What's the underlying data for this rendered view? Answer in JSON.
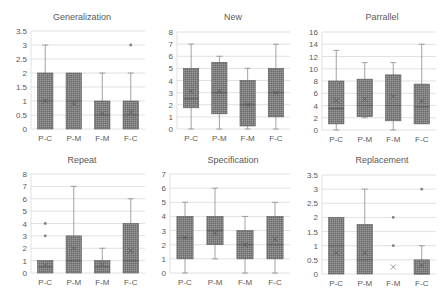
{
  "figure": {
    "box_fill": "#7f7f7f",
    "box_stroke": "#595959",
    "whisker_color": "#8c8c8c",
    "grid_color": "#d9d9d9",
    "text_color": "#595959"
  },
  "chart_data": [
    {
      "type": "boxplot",
      "title": "Generalization",
      "categories": [
        "P-C",
        "P-M",
        "F-M",
        "F-C"
      ],
      "ylim": [
        0,
        3.5
      ],
      "yticks": [
        "0",
        "0.5",
        "1",
        "1.5",
        "2",
        "2.5",
        "3",
        "3.5"
      ],
      "ytick_values": [
        0,
        0.5,
        1,
        1.5,
        2,
        2.5,
        3,
        3.5
      ],
      "grid": true,
      "boxes": [
        {
          "min": 0,
          "q1": 0,
          "median": 1,
          "q3": 2,
          "max": 3,
          "mean": 1.0,
          "outliers": []
        },
        {
          "min": 0,
          "q1": 0,
          "median": 1,
          "q3": 2,
          "max": 2,
          "mean": 0.9,
          "outliers": []
        },
        {
          "min": 0,
          "q1": 0,
          "median": 0.5,
          "q3": 1,
          "max": 2,
          "mean": 0.55,
          "outliers": []
        },
        {
          "min": 0,
          "q1": 0,
          "median": 0.5,
          "q3": 1,
          "max": 2,
          "mean": 0.6,
          "outliers": [
            3
          ]
        }
      ]
    },
    {
      "type": "boxplot",
      "title": "New",
      "categories": [
        "P-C",
        "P-M",
        "F-M",
        "F-C"
      ],
      "ylim": [
        0,
        8
      ],
      "yticks": [
        "0",
        "1",
        "2",
        "3",
        "4",
        "5",
        "6",
        "7",
        "8"
      ],
      "ytick_values": [
        0,
        1,
        2,
        3,
        4,
        5,
        6,
        7,
        8
      ],
      "grid": true,
      "boxes": [
        {
          "min": 0,
          "q1": 1.75,
          "median": 2.5,
          "q3": 5,
          "max": 7,
          "mean": 3.1,
          "outliers": []
        },
        {
          "min": 0,
          "q1": 1.25,
          "median": 3,
          "q3": 5.5,
          "max": 6,
          "mean": 3.1,
          "outliers": []
        },
        {
          "min": 0,
          "q1": 0.25,
          "median": 2,
          "q3": 4,
          "max": 5,
          "mean": 2.0,
          "outliers": []
        },
        {
          "min": 0,
          "q1": 1,
          "median": 3,
          "q3": 5,
          "max": 7,
          "mean": 3.0,
          "outliers": []
        }
      ]
    },
    {
      "type": "boxplot",
      "title": "Parrallel",
      "categories": [
        "P-C",
        "P-M",
        "F-M",
        "F-C"
      ],
      "ylim": [
        0,
        16
      ],
      "yticks": [
        "0",
        "2",
        "4",
        "6",
        "8",
        "10",
        "12",
        "14",
        "16"
      ],
      "ytick_values": [
        0,
        2,
        4,
        6,
        8,
        10,
        12,
        14,
        16
      ],
      "grid": true,
      "boxes": [
        {
          "min": 0,
          "q1": 1,
          "median": 3.5,
          "q3": 8,
          "max": 13,
          "mean": 4.8,
          "outliers": []
        },
        {
          "min": 2,
          "q1": 2.2,
          "median": 4,
          "q3": 8.3,
          "max": 11,
          "mean": 5.0,
          "outliers": []
        },
        {
          "min": 0,
          "q1": 1.5,
          "median": 4,
          "q3": 9,
          "max": 11,
          "mean": 5.5,
          "outliers": []
        },
        {
          "min": 1,
          "q1": 1,
          "median": 3.8,
          "q3": 7.5,
          "max": 14,
          "mean": 4.7,
          "outliers": []
        }
      ]
    },
    {
      "type": "boxplot",
      "title": "Repeat",
      "categories": [
        "P-C",
        "P-M",
        "F-M",
        "F-C"
      ],
      "ylim": [
        0,
        8
      ],
      "yticks": [
        "0",
        "1",
        "2",
        "3",
        "4",
        "5",
        "6",
        "7",
        "8"
      ],
      "ytick_values": [
        0,
        1,
        2,
        3,
        4,
        5,
        6,
        7,
        8
      ],
      "grid": true,
      "boxes": [
        {
          "min": 0,
          "q1": 0,
          "median": 0.5,
          "q3": 1,
          "max": 1,
          "mean": 0.6,
          "outliers": [
            3,
            4
          ]
        },
        {
          "min": 0,
          "q1": 0,
          "median": 1,
          "q3": 3,
          "max": 7,
          "mean": 2.0,
          "outliers": []
        },
        {
          "min": 0,
          "q1": 0,
          "median": 0.5,
          "q3": 1,
          "max": 2,
          "mean": 0.7,
          "outliers": []
        },
        {
          "min": 0,
          "q1": 0,
          "median": 1,
          "q3": 4,
          "max": 6,
          "mean": 1.8,
          "outliers": []
        }
      ]
    },
    {
      "type": "boxplot",
      "title": "Specification",
      "categories": [
        "P-C",
        "P-M",
        "F-M",
        "F-C"
      ],
      "ylim": [
        0,
        7
      ],
      "yticks": [
        "0",
        "1",
        "2",
        "3",
        "4",
        "5",
        "6",
        "7"
      ],
      "ytick_values": [
        0,
        1,
        2,
        3,
        4,
        5,
        6,
        7
      ],
      "grid": true,
      "boxes": [
        {
          "min": 0,
          "q1": 1,
          "median": 2.5,
          "q3": 4,
          "max": 5,
          "mean": 2.5,
          "outliers": []
        },
        {
          "min": 1,
          "q1": 2,
          "median": 3,
          "q3": 4,
          "max": 6,
          "mean": 2.8,
          "outliers": []
        },
        {
          "min": 0,
          "q1": 1,
          "median": 2,
          "q3": 3,
          "max": 4,
          "mean": 2.0,
          "outliers": []
        },
        {
          "min": 0,
          "q1": 1,
          "median": 2,
          "q3": 4,
          "max": 5,
          "mean": 2.4,
          "outliers": []
        }
      ]
    },
    {
      "type": "boxplot",
      "title": "Replacement",
      "categories": [
        "P-C",
        "P-M",
        "F-M",
        "F-C"
      ],
      "ylim": [
        0,
        3.5
      ],
      "yticks": [
        "0",
        "0.5",
        "1",
        "1.5",
        "2",
        "2.5",
        "3",
        "3.5"
      ],
      "ytick_values": [
        0,
        0.5,
        1,
        1.5,
        2,
        2.5,
        3,
        3.5
      ],
      "grid": true,
      "boxes": [
        {
          "min": 0,
          "q1": 0,
          "median": 1,
          "q3": 2,
          "max": 2,
          "mean": 0.75,
          "outliers": []
        },
        {
          "min": 0,
          "q1": 0,
          "median": 0.5,
          "q3": 1.75,
          "max": 3,
          "mean": 0.75,
          "outliers": []
        },
        {
          "min": 0,
          "q1": 0,
          "median": 0,
          "q3": 0,
          "max": 0,
          "mean": 0.25,
          "outliers": [
            1,
            2
          ]
        },
        {
          "min": 0,
          "q1": 0,
          "median": 0,
          "q3": 0.5,
          "max": 1,
          "mean": 0.3,
          "outliers": [
            3
          ]
        }
      ]
    }
  ]
}
